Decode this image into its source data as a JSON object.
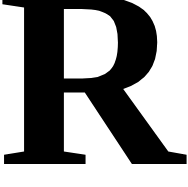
{
  "letter": {
    "text": "R",
    "color": "#000000",
    "background": "#ffffff"
  }
}
